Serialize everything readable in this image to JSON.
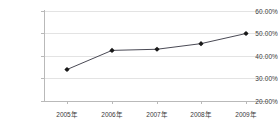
{
  "chart_data": {
    "type": "line",
    "title": "",
    "xlabel": "",
    "ylabel": "",
    "categories": [
      "2005年",
      "2006年",
      "2007年",
      "2008年",
      "2009年"
    ],
    "values": [
      34.0,
      42.5,
      43.0,
      45.5,
      50.0
    ],
    "series": [
      {
        "name": "",
        "values": [
          34.0,
          42.5,
          43.0,
          45.5,
          50.0
        ]
      }
    ],
    "ylim": [
      20.0,
      60.0
    ],
    "ytick_values": [
      20.0,
      30.0,
      40.0,
      50.0,
      60.0
    ],
    "ytick_labels": [
      "20.00%",
      "30.00%",
      "40.00%",
      "50.00%",
      "60.00%"
    ],
    "grid": true,
    "legend": false,
    "legend_position": "none",
    "marker": "diamond",
    "colors": {
      "line": "#4a4a55",
      "marker": "#1a1a1a",
      "gridline": "#e3e3e3",
      "axis": "#b9b9b9",
      "text": "#3a3a3a",
      "background": "#ffffff"
    }
  }
}
